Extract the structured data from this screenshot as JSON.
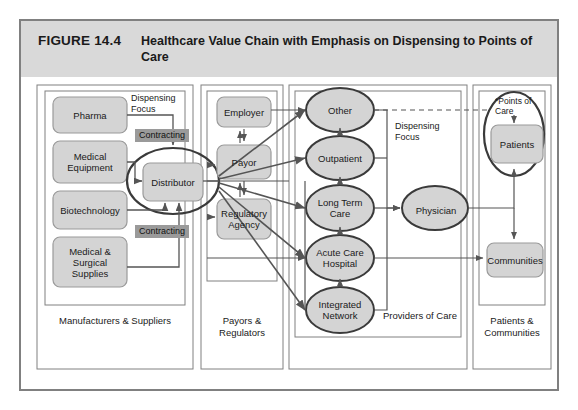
{
  "figure": {
    "number": "FIGURE 14.4",
    "title": "Healthcare Value Chain with Emphasis on Dispensing to Points of Care"
  },
  "columns": [
    {
      "id": "manufacturers",
      "caption": "Manufacturers & Suppliers"
    },
    {
      "id": "payors",
      "caption": "Payors & Regulators"
    },
    {
      "id": "providers",
      "caption": "Providers of Care"
    },
    {
      "id": "patients",
      "caption": "Patients & Communities"
    }
  ],
  "nodes": {
    "pharma": "Pharma",
    "medical_equipment": "Medical Equipment",
    "biotechnology": "Biotechnology",
    "medical_surgical_supplies": "Medical & Surgical Supplies",
    "distributor": "Distributor",
    "employer": "Employer",
    "payor": "Payor",
    "regulatory_agency": "Regulatory Agency",
    "other": "Other",
    "outpatient": "Outpatient",
    "long_term_care": "Long Term Care",
    "acute_care_hospital": "Acute Care Hospital",
    "integrated_network": "Integrated Network",
    "physician": "Physician",
    "patients": "Patients",
    "communities": "Communities"
  },
  "annotations": {
    "dispensing_focus_left": "Dispensing Focus",
    "dispensing_focus_right": "Dispensing Focus",
    "contracting_top": "Contracting",
    "contracting_bottom": "Contracting",
    "points_of_care": "*Points of Care"
  },
  "colors": {
    "header_band": "#d9d9d9",
    "frame_border": "#808080",
    "node_fill": "#d4d4d4",
    "node_stroke": "#9a9a9a",
    "ellipse_stroke": "#3a3a3a",
    "connector": "#555555",
    "tag_fill": "#9a9a9a",
    "page_background": "#ffffff"
  }
}
